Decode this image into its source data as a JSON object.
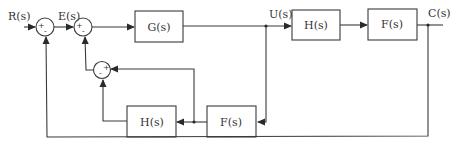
{
  "diagram": {
    "type": "control-system-block-diagram",
    "signals": {
      "input": "R(s)",
      "error": "E(s)",
      "intermediate": "U(s)",
      "output": "C(s)"
    },
    "blocks": {
      "g_forward": "G(s)",
      "h_forward": "H(s)",
      "f_forward": "F(s)",
      "f_feedback": "F(s)",
      "h_feedback": "H(s)"
    },
    "summing_junctions": {
      "sum1": {
        "signs": [
          "+",
          "-"
        ]
      },
      "sum2": {
        "signs": [
          "+",
          "-"
        ]
      },
      "sum3": {
        "signs": [
          "-",
          "+"
        ]
      }
    },
    "colors": {
      "line": "#3a3a3a",
      "background": "#ffffff"
    }
  }
}
